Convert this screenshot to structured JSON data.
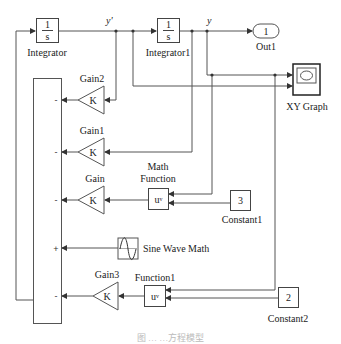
{
  "diagram": {
    "type": "simulink-block-diagram",
    "signals": {
      "y_prime": "y'",
      "y": "y"
    },
    "blocks": {
      "integrator": {
        "label": "Integrator",
        "num": "1",
        "den": "s"
      },
      "integrator1": {
        "label": "Integrator1",
        "num": "1",
        "den": "s"
      },
      "out1": {
        "label": "Out1",
        "value": "1"
      },
      "xy_graph": {
        "label": "XY Graph"
      },
      "gain2": {
        "label": "Gain2",
        "symbol": "K"
      },
      "gain1": {
        "label": "Gain1",
        "symbol": "K"
      },
      "gain": {
        "label": "Gain",
        "symbol": "K"
      },
      "gain3": {
        "label": "Gain3",
        "symbol": "K"
      },
      "math_function": {
        "label_line1": "Math",
        "label_line2": "Function",
        "expr": "u",
        "sup": "v"
      },
      "function1": {
        "label": "Function1",
        "expr": "u",
        "sup": "v"
      },
      "constant1": {
        "label": "Constant1",
        "value": "3"
      },
      "constant2": {
        "label": "Constant2",
        "value": "2"
      },
      "sine_wave": {
        "label": "Sine Wave Math"
      },
      "sum": {
        "signs": [
          "-",
          "-",
          "-",
          "+",
          "-"
        ]
      }
    },
    "caption": "图 …  …方程模型"
  }
}
